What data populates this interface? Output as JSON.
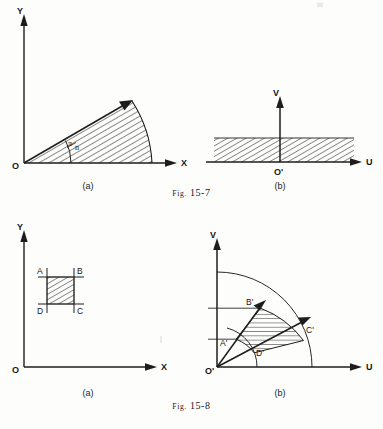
{
  "page": {
    "background_color": "#fdfdfc",
    "ink_color": "#161616",
    "width": 383,
    "height": 429
  },
  "figures": [
    {
      "id": "fig-15-7",
      "caption_prefix": "Fig.",
      "caption_number": "15-7",
      "caption_full": "Fig. 15-7",
      "panels": [
        {
          "id": "fig-15-7-a",
          "label": "(a)",
          "axis_x_label": "X",
          "axis_y_label": "Y",
          "origin_label": "O",
          "angle_label_numerator": "π",
          "angle_label_denominator": "n",
          "angle_label": "π/n",
          "shaded_region": "circular sector from 0 to pi/n",
          "hatching": "diagonal lines"
        },
        {
          "id": "fig-15-7-b",
          "label": "(b)",
          "axis_x_label": "U",
          "axis_y_label": "V",
          "origin_label": "O'",
          "shaded_region": "horizontal strip above the U axis",
          "hatching": "diagonal lines"
        }
      ]
    },
    {
      "id": "fig-15-8",
      "caption_prefix": "Fig.",
      "caption_number": "15-8",
      "caption_full": "Fig. 15-8",
      "panels": [
        {
          "id": "fig-15-8-a",
          "label": "(a)",
          "axis_x_label": "X",
          "axis_y_label": "Y",
          "origin_label": "O",
          "corner_labels": [
            "A",
            "B",
            "C",
            "D"
          ],
          "shaded_region": "square region ABCD",
          "hatching": "diagonal lines"
        },
        {
          "id": "fig-15-8-b",
          "label": "(b)",
          "axis_x_label": "U",
          "axis_y_label": "V",
          "origin_label": "O'",
          "corner_labels": [
            "A'",
            "B'",
            "C'",
            "D'"
          ],
          "shaded_region": "annular sector A'B'C'D'",
          "hatching": "horizontal lines"
        }
      ]
    }
  ]
}
